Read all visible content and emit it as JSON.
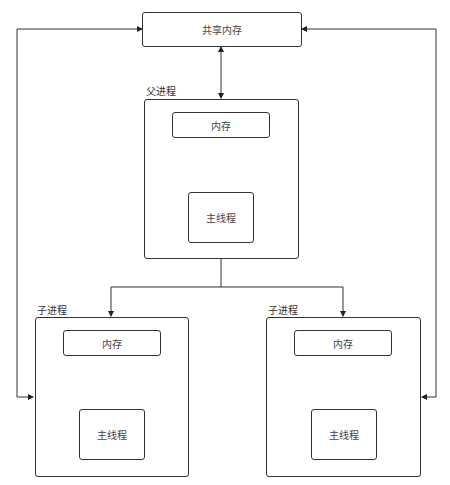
{
  "diagram": {
    "shared_memory": {
      "label": "共享内存"
    },
    "parent": {
      "title": "父进程",
      "memory": "内存",
      "main_thread": "主线程"
    },
    "children": [
      {
        "title": "子进程",
        "memory": "内存",
        "main_thread": "主线程"
      },
      {
        "title": "子进程",
        "memory": "内存",
        "main_thread": "主线程"
      }
    ],
    "colors": {
      "line": "#333333",
      "text": "#444444",
      "background": "#ffffff"
    }
  }
}
